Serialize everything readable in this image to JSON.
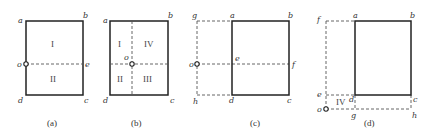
{
  "panels": [
    {
      "caption": "(a)",
      "labels": {
        "a": "a",
        "b": "b",
        "c": "c",
        "d": "d",
        "o": "o",
        "e": "e"
      },
      "regions": [
        "I",
        "II"
      ]
    },
    {
      "caption": "(b)",
      "labels": {
        "a": "a",
        "b": "b",
        "c": "c",
        "d": "d",
        "o": "o"
      },
      "regions": [
        "I",
        "IV",
        "II",
        "III"
      ]
    },
    {
      "caption": "(c)",
      "labels": {
        "g": "g",
        "a": "a",
        "b": "b",
        "o": "o",
        "e": "e",
        "f": "f",
        "h": "h",
        "d": "d",
        "c": "c"
      },
      "regions": []
    },
    {
      "caption": "(d)",
      "labels": {
        "f": "f",
        "a": "a",
        "b": "b",
        "e": "e",
        "d": "d",
        "c": "c",
        "o": "o",
        "g": "g",
        "h": "h"
      },
      "regions": [
        "IV"
      ]
    }
  ]
}
